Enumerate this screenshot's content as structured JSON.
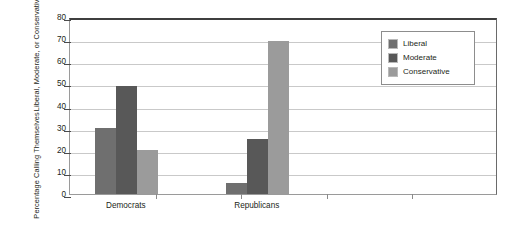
{
  "chart_data": {
    "type": "bar",
    "title": "",
    "subtitle": "",
    "xlabel": "",
    "ylabel_line1": "Percentage Calling Themselves",
    "ylabel_line2": "Liberal, Moderate, or Conservative",
    "categories": [
      "Democrats",
      "Republicans"
    ],
    "series": [
      {
        "name": "Liberal",
        "color": "#6f6f6f",
        "values": [
          30,
          5
        ]
      },
      {
        "name": "Moderate",
        "color": "#585858",
        "values": [
          49,
          25
        ]
      },
      {
        "name": "Conservative",
        "color": "#9b9b9b",
        "values": [
          20,
          69
        ]
      }
    ],
    "ylim": [
      0,
      80
    ],
    "yticks": [
      0,
      10,
      20,
      30,
      40,
      50,
      60,
      70,
      80
    ],
    "ytick_labels": [
      "0",
      "10",
      "20",
      "30",
      "40",
      "50",
      "60",
      "70",
      "80"
    ],
    "grid": true,
    "grid_axis": "y",
    "legend_position": "top-right",
    "legend_entries": [
      "Liberal",
      "Moderate",
      "Conservative"
    ]
  },
  "legend": {
    "items": [
      {
        "label": "Liberal",
        "color": "#6f6f6f"
      },
      {
        "label": "Moderate",
        "color": "#585858"
      },
      {
        "label": "Conservative",
        "color": "#9b9b9b"
      }
    ]
  },
  "colors": {
    "liberal": "#6f6f6f",
    "moderate": "#585858",
    "conservative": "#9b9b9b",
    "gridline": "#c9c9c9",
    "axis": "#4a4a4a",
    "plot_border": "#9a9a9a",
    "text": "#231f20",
    "background": "#ffffff"
  }
}
